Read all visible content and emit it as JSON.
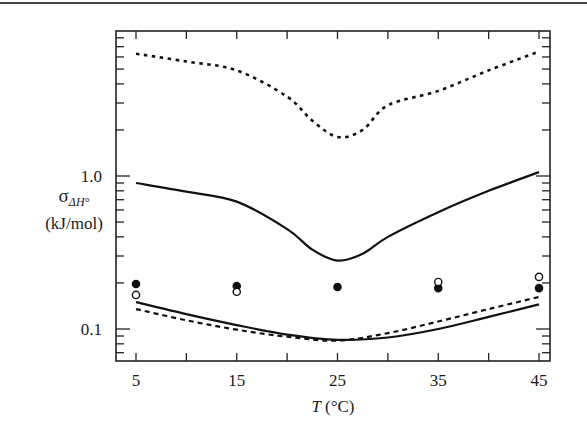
{
  "chart_data": {
    "type": "line",
    "title": "",
    "xlabel": "T (°C)",
    "xlabel_italic_part": "T",
    "xlabel_unit": "(°C)",
    "ylabel": "σΔH° (kJ/mol)",
    "ylabel_symbol": "σ",
    "ylabel_subscript": "ΔH°",
    "ylabel_unit": "(kJ/mol)",
    "yscale": "log",
    "xlim": [
      3.8,
      47.2
    ],
    "ylim": [
      0.058,
      8.9
    ],
    "xticks": [
      5,
      15,
      25,
      35,
      45
    ],
    "xtick_labels": [
      "5",
      "15",
      "25",
      "35",
      "45"
    ],
    "xminor_ticks": [
      10,
      20,
      30,
      40
    ],
    "yticks": [
      0.1,
      1.0
    ],
    "ytick_labels": [
      "0.1",
      "1.0"
    ],
    "grid": false,
    "legend": null,
    "x": [
      5,
      10,
      15,
      20,
      25,
      30,
      35,
      40,
      45
    ],
    "series": [
      {
        "name": "upper-dotted",
        "style": "dotted",
        "x": [
          5,
          10,
          15,
          20,
          22.5,
          25,
          27.5,
          30,
          35,
          40,
          45
        ],
        "values": [
          6.3,
          5.6,
          4.9,
          3.3,
          2.3,
          1.8,
          2.0,
          2.9,
          3.6,
          4.9,
          6.5
        ]
      },
      {
        "name": "middle-solid",
        "style": "solid",
        "x": [
          5,
          10,
          15,
          20,
          22.5,
          25,
          27.5,
          30,
          35,
          40,
          45
        ],
        "values": [
          0.9,
          0.79,
          0.68,
          0.45,
          0.33,
          0.28,
          0.31,
          0.4,
          0.58,
          0.8,
          1.06
        ]
      },
      {
        "name": "lower-solid",
        "style": "solid",
        "x": [
          5,
          10,
          15,
          20,
          25,
          30,
          35,
          40,
          45
        ],
        "values": [
          0.15,
          0.125,
          0.106,
          0.092,
          0.085,
          0.088,
          0.1,
          0.12,
          0.145
        ]
      },
      {
        "name": "lower-dashed",
        "style": "dashed",
        "x": [
          5,
          10,
          15,
          20,
          25,
          30,
          35,
          40,
          45
        ],
        "values": [
          0.135,
          0.114,
          0.099,
          0.089,
          0.084,
          0.094,
          0.112,
          0.135,
          0.162
        ]
      },
      {
        "name": "filled-circles",
        "style": "marker-filled",
        "x": [
          5,
          15,
          25,
          35,
          45
        ],
        "values": [
          0.197,
          0.191,
          0.188,
          0.185,
          0.185
        ]
      },
      {
        "name": "open-circles",
        "style": "marker-open",
        "x": [
          5,
          15,
          35,
          45
        ],
        "values": [
          0.167,
          0.175,
          0.203,
          0.219
        ]
      }
    ]
  }
}
